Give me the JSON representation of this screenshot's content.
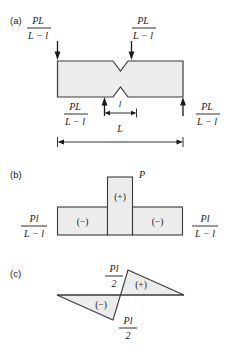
{
  "figure": {
    "caption_labels": {
      "a": "(a)",
      "b": "(b)",
      "c": "(c)"
    },
    "panel_a": {
      "name": "notched-beam-free-body",
      "description": "Notched beam with four applied loads",
      "loads": [
        {
          "id": "load-top-left",
          "numerator": "PL",
          "denominator": "L − l",
          "direction": "down",
          "position": "top-left"
        },
        {
          "id": "load-top-right",
          "numerator": "PL",
          "denominator": "L − l",
          "direction": "down",
          "position": "top-right"
        },
        {
          "id": "load-bottom-left",
          "numerator": "PL",
          "denominator": "L − l",
          "direction": "up",
          "position": "bottom-left"
        },
        {
          "id": "load-bottom-right",
          "numerator": "PL",
          "denominator": "L − l",
          "direction": "up",
          "position": "bottom-right"
        }
      ],
      "dimensions": [
        {
          "id": "dim-notch-width",
          "label": "l"
        },
        {
          "id": "dim-span",
          "label": "L"
        }
      ]
    },
    "panel_b": {
      "name": "shear-force-diagram",
      "description": "Shear force diagram with negative, positive, negative blocks",
      "blocks": [
        {
          "id": "block-left",
          "sign": "(−)"
        },
        {
          "id": "block-center",
          "sign": "(+)"
        },
        {
          "id": "block-right",
          "sign": "(−)"
        }
      ],
      "peak_label": "P",
      "end_values": [
        {
          "id": "shear-left-value",
          "numerator": "Pl",
          "denominator": "L − l"
        },
        {
          "id": "shear-right-value",
          "numerator": "Pl",
          "denominator": "L − l"
        }
      ]
    },
    "panel_c": {
      "name": "bending-moment-diagram",
      "description": "Bending moment diagram with two opposing triangles",
      "regions": [
        {
          "id": "moment-left-region",
          "sign": "(−)"
        },
        {
          "id": "moment-right-region",
          "sign": "(+)"
        }
      ],
      "values": [
        {
          "id": "moment-upper-value",
          "numerator": "Pl",
          "denominator": "2"
        },
        {
          "id": "moment-lower-value",
          "numerator": "Pl",
          "denominator": "2"
        }
      ]
    },
    "colors": {
      "fill": "#ececec",
      "stroke": "#3a3a3a",
      "text": "#1a1a1a",
      "background": "#ffffff"
    }
  }
}
